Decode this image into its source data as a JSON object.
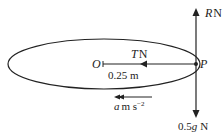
{
  "diagram": {
    "labels": {
      "R": "R",
      "R_unit": "N",
      "T": "T",
      "T_unit": "N",
      "O": "O",
      "P": "P",
      "radius": "0.25 m",
      "accel_sym": "a",
      "accel_unit": "m s",
      "accel_exp": "−2",
      "weight": "0.5",
      "weight_g": "g",
      "weight_unit": "N"
    },
    "colors": {
      "line": "#222222",
      "background": "#ffffff"
    }
  }
}
